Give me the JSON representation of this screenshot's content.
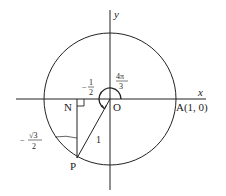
{
  "diagram": {
    "type": "unit-circle",
    "axes": {
      "x_label": "x",
      "y_label": "y"
    },
    "points": {
      "origin": "O",
      "A": "A(1, 0)",
      "N": "N",
      "P": "P"
    },
    "angle_label": {
      "num": "4π",
      "den": "3"
    },
    "x_coord_label": {
      "sign": "−",
      "num": "1",
      "den": "2"
    },
    "y_coord_label": {
      "sign": "−",
      "num": "√3",
      "den": "2"
    },
    "radius_label": "1",
    "colors": {
      "stroke": "#222222",
      "background": "#ffffff"
    }
  }
}
